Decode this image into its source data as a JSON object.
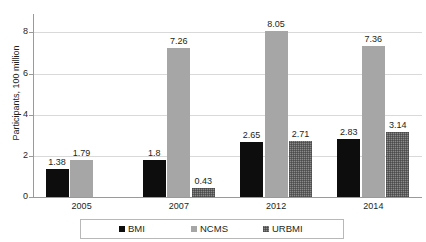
{
  "chart_data": {
    "type": "bar",
    "title": "",
    "subtitle": "",
    "xlabel": "",
    "ylabel": "Participants, 100 million",
    "categories": [
      "2005",
      "2007",
      "2012",
      "2014"
    ],
    "series": [
      {
        "name": "BMI",
        "color": "#0d0d0d",
        "values": [
          1.38,
          1.8,
          2.65,
          2.83
        ]
      },
      {
        "name": "NCMS",
        "color": "#a6a6a6",
        "values": [
          1.79,
          7.26,
          8.05,
          7.36
        ]
      },
      {
        "name": "URBMI",
        "color": "#8a8a8a",
        "values": [
          null,
          0.43,
          2.71,
          3.14
        ]
      }
    ],
    "data_labels": [
      [
        "1.38",
        "1.79",
        ""
      ],
      [
        "1.8",
        "7.26",
        "0.43"
      ],
      [
        "2.65",
        "8.05",
        "2.71"
      ],
      [
        "2.83",
        "7.36",
        "3.14"
      ]
    ],
    "ylim": [
      0,
      8.6
    ],
    "yticks": [
      0,
      2,
      4,
      6,
      8
    ],
    "ytick_labels": [
      "0",
      "2",
      "4",
      "6",
      "8"
    ],
    "grid": true,
    "grid_axis": "y",
    "legend_position": "bottom",
    "legend_entries": [
      "BMI",
      "NCMS",
      "URBMI"
    ]
  },
  "axis": {
    "y_title": "Participants, 100 million"
  },
  "legend": {
    "items": [
      {
        "label": "BMI"
      },
      {
        "label": "NCMS"
      },
      {
        "label": "URBMI"
      }
    ]
  }
}
